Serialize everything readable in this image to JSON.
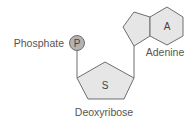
{
  "diagram": {
    "phosphate": {
      "symbol": "P",
      "label": "Phosphate"
    },
    "sugar": {
      "symbol": "S",
      "label": "Deoxyribose"
    },
    "base": {
      "symbol": "A",
      "label": "Adenine"
    },
    "colors": {
      "phosphate_fill": "#b3b3b3",
      "ring_fill": "#e6e6e6",
      "stroke": "#6e6e6e",
      "text": "#555555"
    }
  }
}
